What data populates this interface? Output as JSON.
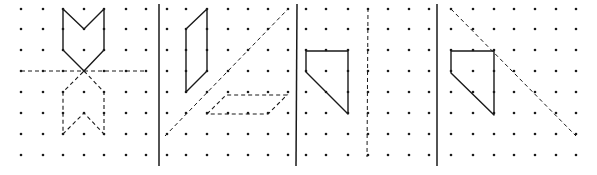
{
  "figure": {
    "colors": {
      "ink": "#1a1a1a",
      "background": "#ffffff"
    },
    "dividers_x": [
      159,
      297,
      437
    ],
    "panels": [
      {
        "id": "panel-1",
        "dots_x": [
          21,
          43,
          63,
          84,
          104,
          126,
          146
        ],
        "dots_y": [
          9,
          29,
          50,
          71,
          92,
          113,
          134,
          155
        ],
        "solid_shapes": [
          {
            "name": "chevron-shape",
            "points": "63,9 84,29 104,9 104,50 84,71 63,50"
          }
        ],
        "dashed_shapes": [
          {
            "name": "reflected-chevron",
            "points": "84,71 104,92 104,134 84,113 63,134 63,92",
            "closed": true
          }
        ],
        "mirror_lines": [
          {
            "x1": 21,
            "y1": 71,
            "x2": 146,
            "y2": 71
          }
        ]
      },
      {
        "id": "panel-2",
        "dots_x": [
          167,
          186,
          207,
          228,
          248,
          268,
          288
        ],
        "dots_y": [
          9,
          29,
          50,
          71,
          92,
          113,
          134,
          155
        ],
        "solid_shapes": [
          {
            "name": "parallelogram-shape",
            "points": "207,9 207,71 186,92 186,29"
          }
        ],
        "dashed_shapes": [
          {
            "name": "reflected-parallelogram",
            "points": "207,114 226,95 287,95 268,114",
            "closed": true
          }
        ],
        "mirror_lines": [
          {
            "x1": 165,
            "y1": 136,
            "x2": 288,
            "y2": 9
          }
        ]
      },
      {
        "id": "panel-3",
        "dots_x": [
          306,
          326,
          348,
          368,
          388,
          409,
          429
        ],
        "dots_y": [
          9,
          29,
          50,
          71,
          92,
          113,
          134,
          155
        ],
        "solid_shapes": [
          {
            "name": "pentagon-shape",
            "points": "306,51 348,51 348,114 306,72"
          }
        ],
        "dashed_shapes": [],
        "mirror_lines": [
          {
            "x1": 368,
            "y1": 8,
            "x2": 367,
            "y2": 157
          }
        ]
      },
      {
        "id": "panel-4",
        "dots_x": [
          451,
          473,
          494,
          514,
          535,
          556,
          576
        ],
        "dots_y": [
          9,
          29,
          50,
          71,
          92,
          113,
          134,
          155
        ],
        "solid_shapes": [
          {
            "name": "pentagon-shape",
            "points": "451,51 494,51 494,115 451,73"
          }
        ],
        "dashed_shapes": [],
        "mirror_lines": [
          {
            "x1": 451,
            "y1": 9,
            "x2": 576,
            "y2": 136
          }
        ]
      }
    ]
  }
}
